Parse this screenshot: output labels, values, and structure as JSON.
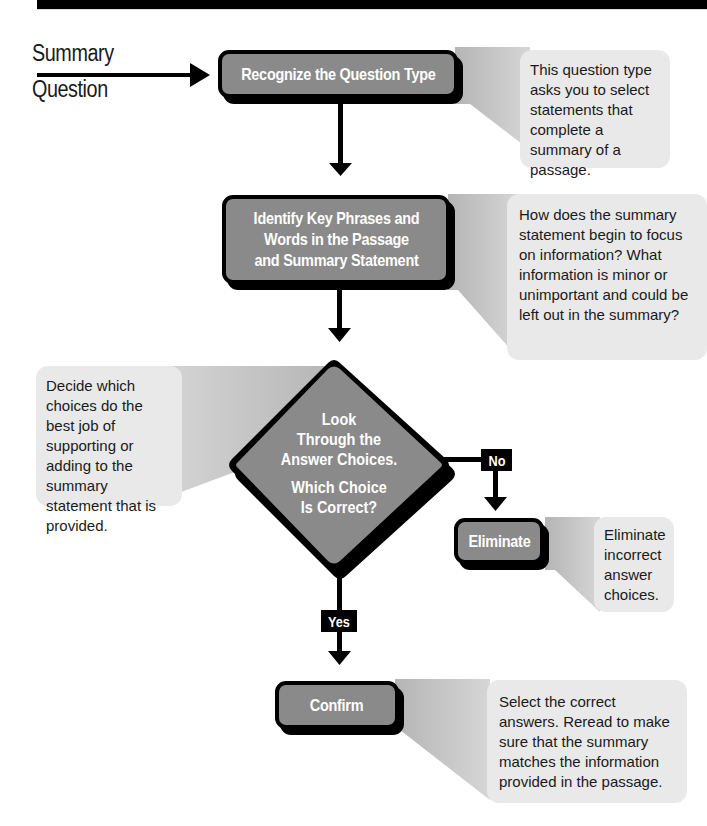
{
  "diagram": {
    "type": "flowchart",
    "start": {
      "line1": "Summary",
      "line2": "Question"
    },
    "steps": [
      {
        "id": "recognize",
        "label": "Recognize the Question Type",
        "note": "This question type asks you to select statements that complete a summary of a passage."
      },
      {
        "id": "identify",
        "label_lines": [
          "Identify Key Phrases and",
          "Words in the Passage",
          "and Summary Statement"
        ],
        "note": "How does the summary statement begin to focus on information? What information is minor or unimportant and could be left out in the summary?"
      },
      {
        "id": "decision",
        "label_lines": [
          "Look",
          "Through the",
          "Answer Choices."
        ],
        "question_lines": [
          "Which Choice",
          "Is Correct?"
        ],
        "note": "Decide which choices do the best job of supporting or adding to the summary statement that is provided."
      },
      {
        "id": "eliminate",
        "label": "Eliminate",
        "note": "Eliminate incorrect answer choices."
      },
      {
        "id": "confirm",
        "label": "Confirm",
        "note": "Select the correct answers. Reread to make sure that the summary matches the information provided in the passage."
      }
    ],
    "branches": {
      "no": "No",
      "yes": "Yes"
    },
    "colors": {
      "box_fill": "#8a8a8a",
      "box_border": "#000000",
      "note_fill": "#e9e9e9",
      "wedge_fill": "#c4c4c4",
      "banner": "#000000"
    }
  }
}
